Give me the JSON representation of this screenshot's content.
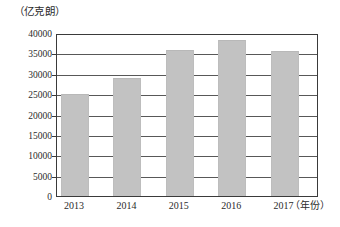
{
  "chart_data": {
    "type": "bar",
    "title": "",
    "xlabel": "（年份）",
    "ylabel": "（亿克朗）",
    "categories": [
      "2013",
      "2014",
      "2015",
      "2016",
      "2017"
    ],
    "values": [
      25000,
      29000,
      35800,
      38200,
      35500
    ],
    "ylim": [
      0,
      40000
    ],
    "ytick_labels": [
      "0",
      "5000",
      "10000",
      "15000",
      "20000",
      "25000",
      "30000",
      "35000",
      "40000"
    ],
    "ytick_values": [
      0,
      5000,
      10000,
      15000,
      20000,
      25000,
      30000,
      35000,
      40000
    ],
    "grid": "horizontal",
    "legend": "none",
    "series": [
      {
        "name": "",
        "values": [
          25000,
          29000,
          35800,
          38200,
          35500
        ],
        "color": "#c2c2c2"
      }
    ],
    "colors": {
      "bar_fill": "#c2c2c2",
      "axis": "#3a3a3a",
      "grid": "#585858",
      "text": "#2b2b2b",
      "background": "#ffffff"
    }
  }
}
